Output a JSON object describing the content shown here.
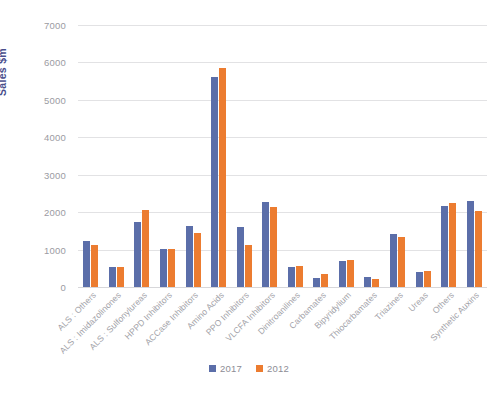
{
  "chart_data": {
    "type": "bar",
    "title": "",
    "xlabel": "",
    "ylabel": "Sales  $m",
    "ylim": [
      0,
      7000
    ],
    "ytick_labels": [
      "7000",
      "6000",
      "5000",
      "4000",
      "3000",
      "2000",
      "1000",
      "0"
    ],
    "yticks": [
      7000,
      6000,
      5000,
      4000,
      3000,
      2000,
      1000,
      0
    ],
    "grid": true,
    "legend_position": "bottom",
    "categories": [
      "ALS : Others",
      "ALS : Imidazolinones",
      "ALS : Sulfonylureas",
      "HPPD Inhibitors",
      "ACCase Inhibitors",
      "Amino Acids",
      "PPO Inhibitors",
      "VLCFA Inhibitors",
      "Dinitroanilines",
      "Carbamates",
      "Bipyridylium",
      "Thiocarbamates",
      "Triazines",
      "Ureas",
      "Others",
      "Synthetic Auxins"
    ],
    "series": [
      {
        "name": "2017",
        "color": "#5b6ea9",
        "values": [
          1230,
          530,
          1750,
          1020,
          1620,
          5620,
          1600,
          2260,
          540,
          240,
          700,
          280,
          1410,
          400,
          2170,
          2290
        ]
      },
      {
        "name": "2012",
        "color": "#ec7c30",
        "values": [
          1130,
          545,
          2070,
          1020,
          1430,
          5860,
          1120,
          2150,
          570,
          340,
          720,
          220,
          1340,
          430,
          2250,
          2020
        ]
      }
    ]
  },
  "legend": {
    "items": [
      {
        "label": "2017",
        "color": "#5b6ea9"
      },
      {
        "label": "2012",
        "color": "#ec7c30"
      }
    ]
  },
  "colors": {
    "series_2017": "#5b6ea9",
    "series_2012": "#ec7c30",
    "axis_title": "#4a4f8c",
    "tick_text": "#9b9ba2",
    "gridline": "#e2e2e4",
    "background": "#ffffff"
  }
}
